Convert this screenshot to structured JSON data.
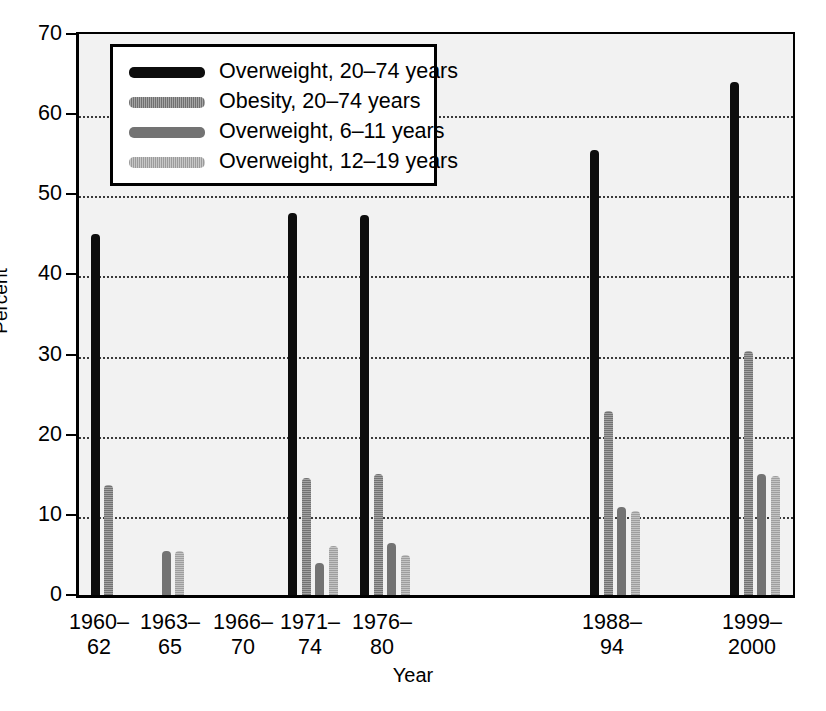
{
  "chart_data": {
    "type": "bar",
    "title": "",
    "xlabel": "Year",
    "ylabel": "Percent",
    "ylim": [
      0,
      70
    ],
    "ytick_values": [
      0,
      10,
      20,
      30,
      40,
      50,
      60,
      70
    ],
    "ytick_labels": [
      "0",
      "10",
      "20",
      "30",
      "40",
      "50",
      "60",
      "70"
    ],
    "grid": "horizontal-dotted",
    "legend_position": "upper-left-inside",
    "categories": [
      "1960–62",
      "1963–65",
      "1966–70",
      "1971–74",
      "1976–80",
      "1988–94",
      "1999–2000"
    ],
    "category_lines": [
      [
        "1960–",
        "62"
      ],
      [
        "1963–",
        "65"
      ],
      [
        "1966–",
        "70"
      ],
      [
        "1971–",
        "74"
      ],
      [
        "1976–",
        "80"
      ],
      [
        "1988–",
        "94"
      ],
      [
        "1999–",
        "2000"
      ]
    ],
    "series": [
      {
        "name": "Overweight, 20–74 years",
        "color": "#0d0d0d",
        "values": [
          45.1,
          null,
          null,
          47.7,
          47.4,
          55.5,
          64.0
        ]
      },
      {
        "name": "Obesity, 20–74 years",
        "color": "#8f8f8f",
        "values": [
          13.7,
          null,
          null,
          14.6,
          15.1,
          23.0,
          30.5
        ]
      },
      {
        "name": "Overweight, 6–11 years",
        "color": "#737373",
        "values": [
          null,
          5.5,
          null,
          4.0,
          6.5,
          11.0,
          15.1
        ]
      },
      {
        "name": "Overweight, 12–19 years",
        "color": "#b4b4b4",
        "values": [
          null,
          5.5,
          null,
          6.1,
          5.0,
          10.5,
          14.9
        ]
      }
    ]
  },
  "legend": {
    "items": [
      {
        "label": "Overweight, 20–74 years"
      },
      {
        "label": "Obesity, 20–74 years"
      },
      {
        "label": "Overweight, 6–11 years"
      },
      {
        "label": "Overweight, 12–19 years"
      }
    ]
  },
  "axes": {
    "y_title": "Percent",
    "x_title": "Year"
  }
}
